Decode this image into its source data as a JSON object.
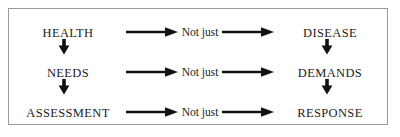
{
  "figure": {
    "border_color": "#9a9a9a",
    "background_color": "#ffffff",
    "text_color": "#1c1c1c",
    "arrow_color": "#111111"
  },
  "rows": [
    {
      "left": "HEALTH",
      "middle": "Not just",
      "right": "DISEASE"
    },
    {
      "left": "NEEDS",
      "middle": "Not just",
      "right": "DEMANDS"
    },
    {
      "left": "ASSESSMENT",
      "middle": "Not just",
      "right": "RESPONSE"
    }
  ],
  "icons": {
    "right_arrow": "arrow-right-icon",
    "down_arrow": "arrow-down-icon"
  }
}
